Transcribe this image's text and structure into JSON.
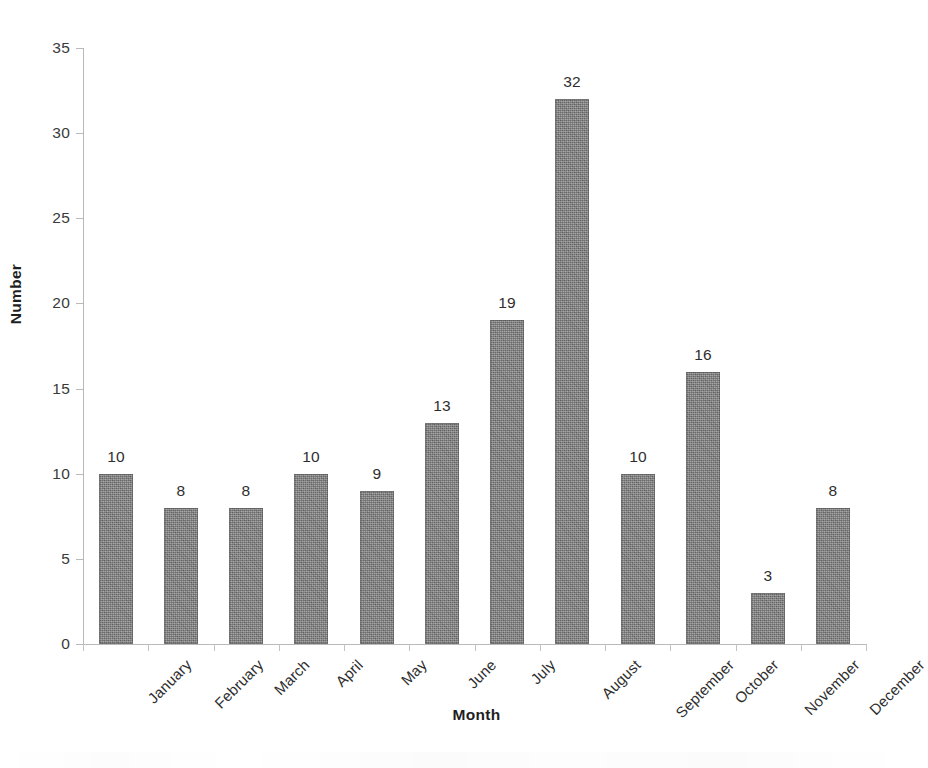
{
  "chart_data": {
    "type": "bar",
    "title": "",
    "xlabel": "Month",
    "ylabel": "Number",
    "categories": [
      "January",
      "February",
      "March",
      "April",
      "May",
      "June",
      "July",
      "August",
      "September",
      "October",
      "November",
      "December"
    ],
    "values": [
      10,
      8,
      8,
      10,
      9,
      13,
      19,
      32,
      10,
      16,
      3,
      8
    ],
    "value_labels": [
      "10",
      "8",
      "8",
      "10",
      "9",
      "13",
      "19",
      "32",
      "10",
      "16",
      "3",
      "8"
    ],
    "ylim": [
      0,
      35
    ],
    "ytick_values": [
      0,
      5,
      10,
      15,
      20,
      25,
      30,
      35
    ],
    "ytick_labels": [
      "0",
      "5",
      "10",
      "15",
      "20",
      "25",
      "30",
      "35"
    ],
    "grid": false,
    "legend": false,
    "legend_position": "none",
    "bar_color": "#7c7c7c",
    "axis_color": "#b9b9b9",
    "text_color": "#2e2e2e",
    "background": "#ffffff",
    "xtick_label_rotation": -45,
    "show_value_labels": true
  }
}
